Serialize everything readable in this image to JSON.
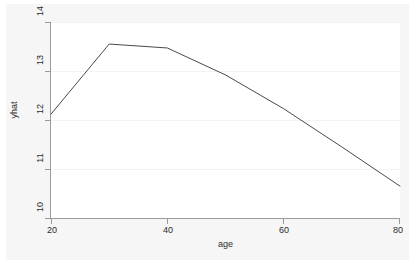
{
  "chart_data": {
    "type": "line",
    "title": "",
    "subtitle": "",
    "xlabel": "age",
    "ylabel": "yhat",
    "xlim": [
      20,
      80
    ],
    "ylim": [
      10,
      14
    ],
    "xticks": [
      20,
      40,
      60,
      80
    ],
    "xtick_labels": [
      "20",
      "40",
      "60",
      "80"
    ],
    "yticks": [
      10,
      11,
      12,
      13,
      14
    ],
    "ytick_labels": [
      "10",
      "11",
      "12",
      "13",
      "14"
    ],
    "grid": true,
    "legend": null,
    "legend_position": "none",
    "series": [
      {
        "name": "yhat",
        "color": "#4a4a4a",
        "x": [
          20,
          30,
          40,
          50,
          60,
          70,
          80
        ],
        "values": [
          12.12,
          13.55,
          13.47,
          12.92,
          12.23,
          11.45,
          10.65
        ]
      }
    ],
    "annotations": []
  },
  "axes": {
    "x_title": "age",
    "y_title": "yhat",
    "x_tick_labels": [
      "20",
      "40",
      "60",
      "80"
    ],
    "y_tick_labels": [
      "10",
      "11",
      "12",
      "13",
      "14"
    ]
  },
  "colors": {
    "line": "#4a4a4a",
    "axis": "#9a9a9a",
    "grid": "#f3f3f3",
    "plot_background": "#ffffff",
    "graph_background": "#f6f6f6",
    "text": "#2b2b2b"
  }
}
